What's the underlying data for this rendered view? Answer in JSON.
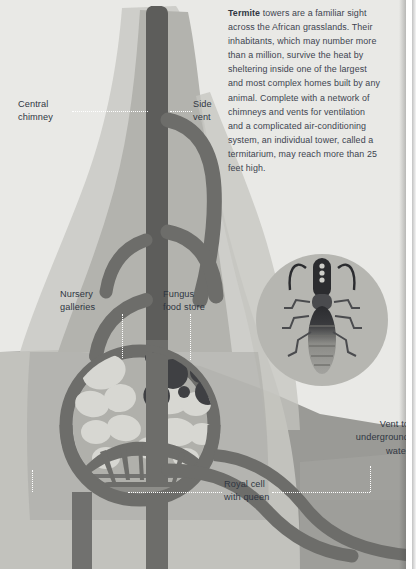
{
  "page": {
    "background_color": "#d8d8d4"
  },
  "body_copy": {
    "lead_word": "Termite",
    "text": " towers are a familiar sight across the African grasslands. Their inhabitants, which may number more than a million, survive the heat by sheltering inside one of the largest and most complex homes built by any animal. Complete with a network of chimneys and vents for ventilation and a complicated air-conditioning system, an individual tower, called a termitarium, may reach more than 25 feet high."
  },
  "callouts": {
    "central_chimney": "Central\nchimney",
    "side_vent": "Side\nvent",
    "nursery_galleries": "Nursery\ngalleries",
    "fungus_food_store": "Fungus\nfood store",
    "royal_cell": "Royal cell\nwith queen",
    "vent_underground_water": "Vent to\nunderground\nwater"
  },
  "illustration": {
    "termite_medallion": "termite-icon",
    "mound": "termite-mound-cutaway",
    "colors": {
      "sky": "#e9e9e6",
      "soil": "#9a9a96",
      "soil_deep": "#8e8e8a",
      "mound_light": "#c9c9c4",
      "mound_mid": "#b3b3ae",
      "tunnel": "#6d6d6a",
      "chimney_dark": "#5d5d5b",
      "gallery_light": "#d7d7d2",
      "fungus_dark": "#3f4043",
      "medallion": "#b6b6b1",
      "text": "#2f3642"
    }
  }
}
